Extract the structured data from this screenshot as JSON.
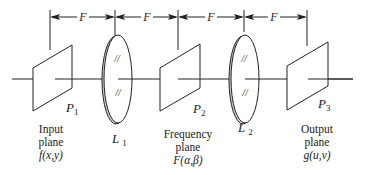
{
  "diagram": {
    "dimension_label": "F",
    "dimensions": [
      {
        "label": "F"
      },
      {
        "label": "F"
      },
      {
        "label": "F"
      },
      {
        "label": "F"
      }
    ],
    "planes": [
      {
        "id": "P1",
        "symbol": "P",
        "subscript": "1",
        "caption": [
          "Input",
          "plane",
          "f(x,y)"
        ]
      },
      {
        "id": "P2",
        "symbol": "P",
        "subscript": "2",
        "caption": [
          "Frequency",
          "plane",
          "F(α,β)"
        ]
      },
      {
        "id": "P3",
        "symbol": "P",
        "subscript": "3",
        "caption": [
          "Output",
          "plane",
          "g(u,v)"
        ]
      }
    ],
    "lenses": [
      {
        "id": "L1",
        "symbol": "L",
        "subscript": "1"
      },
      {
        "id": "L2",
        "symbol": "L",
        "subscript": "2"
      }
    ],
    "colors": {
      "line": "#222222",
      "lens_rim": "#cccccc",
      "background": "#ffffff"
    }
  }
}
